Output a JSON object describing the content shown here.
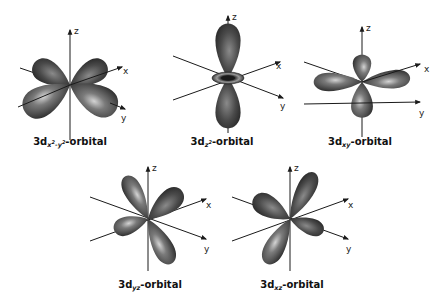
{
  "figure": {
    "axis_labels": {
      "x": "x",
      "y": "y",
      "z": "z"
    },
    "colors": {
      "lobe_dark": "#2a2a2a",
      "lobe_mid": "#5a5a5a",
      "lobe_light": "#cfcfcf",
      "axis": "#1a1a1a",
      "background": "#ffffff"
    },
    "orbitals": [
      {
        "id": "dx2-y2",
        "prefix": "3d",
        "sub_main": "x",
        "sub_sup1": "2",
        "sub_mid": "-y",
        "sub_sup2": "2",
        "suffix": "-orbital"
      },
      {
        "id": "dz2",
        "prefix": "3d",
        "sub_main": "z",
        "sub_sup1": "2",
        "suffix": "-orbital"
      },
      {
        "id": "dxy",
        "prefix": "3d",
        "sub_main": "xy",
        "suffix": "-orbital"
      },
      {
        "id": "dyz",
        "prefix": "3d",
        "sub_main": "yz",
        "suffix": "-orbital"
      },
      {
        "id": "dxz",
        "prefix": "3d",
        "sub_main": "xz",
        "suffix": "-orbital"
      }
    ]
  }
}
